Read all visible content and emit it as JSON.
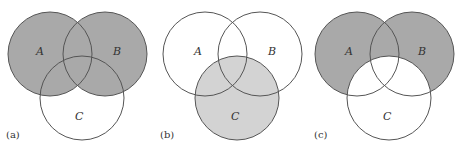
{
  "figure": {
    "style": {
      "stroke": "#555555",
      "dark_fill": "#a9a9a9",
      "light_fill": "#d3d3d3",
      "background": "#ffffff"
    },
    "panels": [
      {
        "label": "(a)",
        "shaded_region": "A ∪ B",
        "sets": {
          "A": "A",
          "B": "B",
          "C": "C"
        }
      },
      {
        "label": "(b)",
        "shaded_region": "C",
        "sets": {
          "A": "A",
          "B": "B",
          "C": "C"
        }
      },
      {
        "label": "(c)",
        "shaded_region": "(A ∪ B) − C",
        "sets": {
          "A": "A",
          "B": "B",
          "C": "C"
        }
      }
    ]
  }
}
